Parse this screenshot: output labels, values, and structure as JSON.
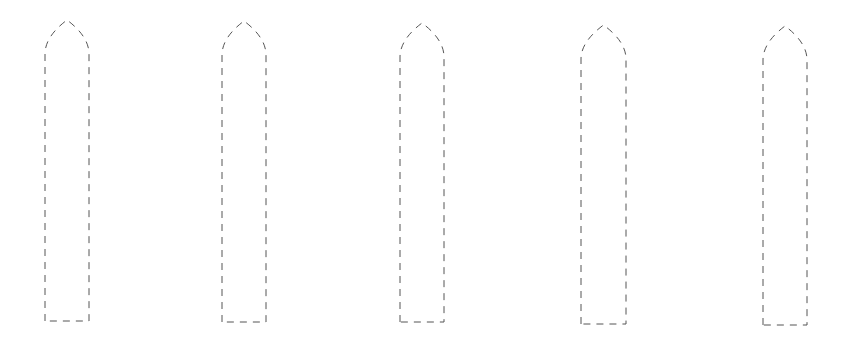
{
  "diagram": {
    "stroke_color": "#555555",
    "background": "#ffffff",
    "shapes": [
      {
        "id": 1,
        "x": 45,
        "top": 20,
        "width": 44,
        "bottom": 321
      },
      {
        "id": 2,
        "x": 222,
        "top": 21,
        "width": 44,
        "bottom": 322
      },
      {
        "id": 3,
        "x": 400,
        "top": 23,
        "width": 44,
        "bottom": 322
      },
      {
        "id": 4,
        "x": 581,
        "top": 25,
        "width": 45,
        "bottom": 324
      },
      {
        "id": 5,
        "x": 763,
        "top": 26,
        "width": 44,
        "bottom": 325
      }
    ]
  }
}
